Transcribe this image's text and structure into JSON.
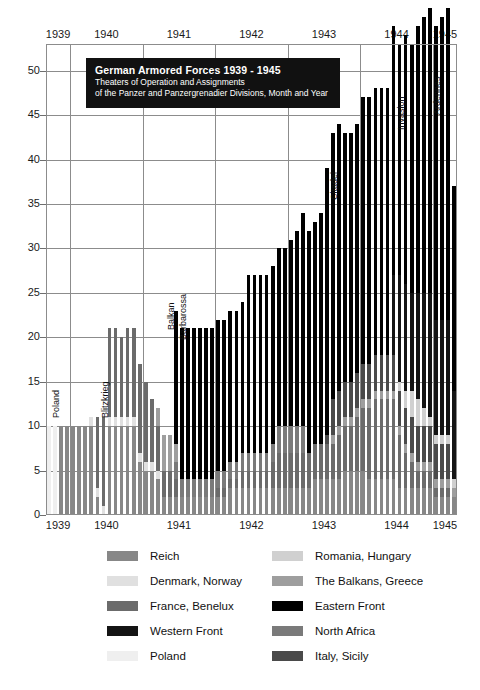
{
  "title": {
    "main": "German Armored Forces 1939 - 1945",
    "sub1": "Theaters of Operation and Assignments",
    "sub2": "of the Panzer and Panzergrenadier Divisions, Month and Year"
  },
  "chart_data": {
    "type": "bar",
    "stacked": true,
    "title": "German Armored Forces 1939 - 1945",
    "subtitle": "Theaters of Operation and Assignments of the Panzer and Panzergrenadier Divisions, Month and Year",
    "xlabel": "",
    "ylabel": "",
    "ylim": [
      0,
      53
    ],
    "yticks": [
      0,
      5,
      10,
      15,
      20,
      25,
      30,
      35,
      40,
      45,
      50
    ],
    "grid": true,
    "legend_position": "below",
    "x_axis_top_labels": [
      "1939",
      "1940",
      "1941",
      "1942",
      "1943",
      "1944",
      "1945"
    ],
    "x_axis_bottom_labels": [
      "1939",
      "1940",
      "1941",
      "1942",
      "1943",
      "1944",
      "1945"
    ],
    "x_unit": "month",
    "x_start": "1939-09",
    "x_end": "1945-04",
    "categories": [
      "1939-09",
      "1939-10",
      "1939-11",
      "1939-12",
      "1940-01",
      "1940-02",
      "1940-03",
      "1940-04",
      "1940-05",
      "1940-06",
      "1940-07",
      "1940-08",
      "1940-09",
      "1940-10",
      "1940-11",
      "1940-12",
      "1941-01",
      "1941-02",
      "1941-03",
      "1941-04",
      "1941-05",
      "1941-06",
      "1941-07",
      "1941-08",
      "1941-09",
      "1941-10",
      "1941-11",
      "1941-12",
      "1942-01",
      "1942-02",
      "1942-03",
      "1942-04",
      "1942-05",
      "1942-06",
      "1942-07",
      "1942-08",
      "1942-09",
      "1942-10",
      "1942-11",
      "1942-12",
      "1943-01",
      "1943-02",
      "1943-03",
      "1943-04",
      "1943-05",
      "1943-06",
      "1943-07",
      "1943-08",
      "1943-09",
      "1943-10",
      "1943-11",
      "1943-12",
      "1944-01",
      "1944-02",
      "1944-03",
      "1944-04",
      "1944-05",
      "1944-06",
      "1944-07",
      "1944-08",
      "1944-09",
      "1944-10",
      "1944-11",
      "1944-12",
      "1945-01",
      "1945-02",
      "1945-03",
      "1945-04"
    ],
    "series": [
      {
        "name": "Poland",
        "color": "#efefef",
        "values": [
          10,
          10,
          0,
          0,
          0,
          0,
          0,
          0,
          0,
          0,
          0,
          0,
          0,
          0,
          0,
          0,
          0,
          0,
          0,
          0,
          0,
          0,
          0,
          0,
          0,
          0,
          0,
          0,
          0,
          0,
          0,
          0,
          0,
          0,
          0,
          0,
          0,
          0,
          0,
          0,
          0,
          0,
          0,
          0,
          0,
          0,
          0,
          0,
          0,
          0,
          0,
          0,
          0,
          0,
          0,
          0,
          0,
          0,
          0,
          0,
          0,
          0,
          0,
          0,
          0,
          0,
          0,
          0
        ]
      },
      {
        "name": "Reich",
        "color": "#878787",
        "values": [
          0,
          0,
          10,
          10,
          10,
          10,
          10,
          10,
          2,
          0,
          10,
          10,
          10,
          10,
          10,
          6,
          5,
          5,
          4,
          2,
          2,
          2,
          2,
          2,
          2,
          2,
          2,
          2,
          2,
          2,
          3,
          3,
          3,
          3,
          3,
          3,
          3,
          3,
          3,
          3,
          3,
          3,
          3,
          3,
          4,
          4,
          4,
          4,
          4,
          5,
          5,
          5,
          5,
          4,
          4,
          4,
          4,
          4,
          3,
          3,
          3,
          3,
          3,
          3,
          2,
          2,
          2,
          2
        ]
      },
      {
        "name": "Denmark, Norway",
        "color": "#e0e0e0",
        "values": [
          0,
          0,
          0,
          0,
          0,
          0,
          0,
          1,
          1,
          1,
          1,
          1,
          1,
          1,
          1,
          1,
          1,
          1,
          1,
          0,
          0,
          0,
          0,
          0,
          0,
          0,
          0,
          0,
          0,
          0,
          0,
          0,
          0,
          0,
          0,
          0,
          0,
          0,
          0,
          0,
          0,
          0,
          0,
          0,
          0,
          0,
          0,
          0,
          0,
          0,
          0,
          0,
          0,
          0,
          0,
          0,
          0,
          0,
          0,
          0,
          0,
          0,
          0,
          0,
          0,
          0,
          0,
          0
        ]
      },
      {
        "name": "France, Benelux",
        "color": "#6b6b6b",
        "values": [
          0,
          0,
          0,
          0,
          0,
          0,
          0,
          0,
          8,
          10,
          10,
          10,
          9,
          10,
          10,
          10,
          9,
          7,
          5,
          3,
          3,
          2,
          0,
          0,
          0,
          0,
          0,
          0,
          1,
          1,
          1,
          1,
          2,
          2,
          2,
          2,
          2,
          3,
          4,
          4,
          4,
          4,
          4,
          4,
          4,
          4,
          4,
          4,
          5,
          5,
          5,
          6,
          7,
          8,
          9,
          9,
          9,
          9,
          6,
          4,
          3,
          2,
          2,
          2,
          1,
          1,
          1,
          0
        ]
      },
      {
        "name": "Western Front",
        "color": "#141414",
        "values": [
          0,
          0,
          0,
          0,
          0,
          0,
          0,
          0,
          0,
          0,
          0,
          0,
          0,
          0,
          0,
          0,
          0,
          0,
          0,
          0,
          0,
          0,
          0,
          0,
          0,
          0,
          0,
          0,
          0,
          0,
          0,
          0,
          0,
          0,
          0,
          0,
          0,
          0,
          0,
          0,
          0,
          0,
          0,
          0,
          0,
          0,
          0,
          0,
          0,
          0,
          0,
          0,
          0,
          0,
          0,
          0,
          0,
          9,
          12,
          12,
          11,
          12,
          13,
          14,
          13,
          13,
          13,
          10
        ]
      },
      {
        "name": "Romania, Hungary",
        "color": "#d0d0d0",
        "values": [
          0,
          0,
          0,
          0,
          0,
          0,
          0,
          0,
          0,
          0,
          0,
          0,
          0,
          0,
          0,
          0,
          0,
          0,
          0,
          0,
          0,
          0,
          0,
          0,
          0,
          0,
          0,
          0,
          0,
          0,
          0,
          0,
          0,
          0,
          0,
          0,
          0,
          0,
          0,
          0,
          0,
          0,
          0,
          0,
          0,
          0,
          0,
          0,
          0,
          0,
          0,
          0,
          0,
          0,
          0,
          0,
          0,
          0,
          1,
          2,
          3,
          3,
          2,
          1,
          1,
          1,
          1,
          1
        ]
      },
      {
        "name": "The Balkans, Greece",
        "color": "#9e9e9e",
        "values": [
          0,
          0,
          0,
          0,
          0,
          0,
          0,
          0,
          0,
          0,
          0,
          0,
          0,
          0,
          0,
          0,
          0,
          0,
          2,
          4,
          4,
          2,
          0,
          0,
          0,
          0,
          0,
          0,
          0,
          0,
          0,
          0,
          0,
          0,
          0,
          0,
          0,
          0,
          0,
          0,
          0,
          0,
          0,
          0,
          0,
          0,
          0,
          1,
          1,
          1,
          1,
          1,
          1,
          1,
          1,
          1,
          1,
          1,
          1,
          1,
          1,
          1,
          1,
          1,
          1,
          1,
          1,
          1
        ]
      },
      {
        "name": "Eastern Front",
        "color": "#000000",
        "values": [
          0,
          0,
          0,
          0,
          0,
          0,
          0,
          0,
          0,
          0,
          0,
          0,
          0,
          0,
          0,
          0,
          0,
          0,
          0,
          0,
          0,
          15,
          17,
          17,
          17,
          17,
          17,
          17,
          17,
          17,
          17,
          17,
          17,
          20,
          20,
          20,
          20,
          20,
          20,
          20,
          21,
          22,
          24,
          25,
          25,
          26,
          30,
          30,
          30,
          28,
          28,
          28,
          30,
          30,
          30,
          30,
          30,
          28,
          26,
          28,
          28,
          30,
          31,
          32,
          33,
          34,
          35,
          23
        ]
      },
      {
        "name": "North Africa",
        "color": "#7a7a7a",
        "values": [
          0,
          0,
          0,
          0,
          0,
          0,
          0,
          0,
          0,
          0,
          0,
          0,
          0,
          0,
          0,
          0,
          0,
          0,
          0,
          0,
          0,
          2,
          2,
          2,
          2,
          2,
          2,
          2,
          2,
          2,
          2,
          2,
          2,
          2,
          2,
          2,
          2,
          2,
          3,
          3,
          3,
          3,
          3,
          0,
          0,
          0,
          0,
          0,
          0,
          0,
          0,
          0,
          0,
          0,
          0,
          0,
          0,
          0,
          0,
          0,
          0,
          0,
          0,
          0,
          0,
          0,
          0,
          0
        ]
      },
      {
        "name": "Italy, Sicily",
        "color": "#4a4a4a",
        "values": [
          0,
          0,
          0,
          0,
          0,
          0,
          0,
          0,
          0,
          0,
          0,
          0,
          0,
          0,
          0,
          0,
          0,
          0,
          0,
          0,
          0,
          0,
          0,
          0,
          0,
          0,
          0,
          0,
          0,
          0,
          0,
          0,
          0,
          0,
          0,
          0,
          0,
          0,
          0,
          0,
          0,
          0,
          0,
          0,
          0,
          0,
          1,
          4,
          4,
          4,
          4,
          4,
          4,
          4,
          4,
          4,
          4,
          4,
          4,
          4,
          4,
          4,
          4,
          4,
          4,
          4,
          4,
          0
        ]
      }
    ],
    "annotations": [
      {
        "label": "Poland",
        "x_index": 0
      },
      {
        "label": "Blitzkrieg",
        "x_index": 8
      },
      {
        "label": "Balkan",
        "x_index": 19
      },
      {
        "label": "Barbarossa",
        "x_index": 21
      },
      {
        "label": "Citadel",
        "x_index": 46
      },
      {
        "label": "Invasion",
        "x_index": 57
      },
      {
        "label": "Ardennes",
        "x_index": 63
      }
    ]
  },
  "legend": {
    "left": [
      {
        "label": "Reich",
        "color": "#878787"
      },
      {
        "label": "Denmark, Norway",
        "color": "#e0e0e0"
      },
      {
        "label": "France, Benelux",
        "color": "#6b6b6b"
      },
      {
        "label": "Western Front",
        "color": "#141414"
      },
      {
        "label": "Poland",
        "color": "#efefef"
      }
    ],
    "right": [
      {
        "label": "Romania, Hungary",
        "color": "#d0d0d0"
      },
      {
        "label": "The Balkans, Greece",
        "color": "#9e9e9e"
      },
      {
        "label": "Eastern Front",
        "color": "#000000"
      },
      {
        "label": "North Africa",
        "color": "#7a7a7a"
      },
      {
        "label": "Italy, Sicily",
        "color": "#4a4a4a"
      }
    ]
  }
}
